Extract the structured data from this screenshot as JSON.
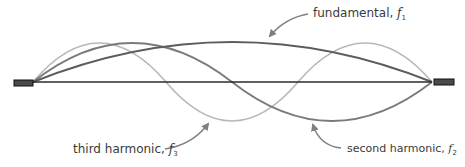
{
  "diagram": {
    "colors": {
      "string": "#2b2b2b",
      "clamp_fill": "#4a4a4a",
      "clamp_border": "#111111",
      "fundamental": "#5c5c5c",
      "second_harmonic": "#7a7a7a",
      "third_harmonic": "#b8b8b8",
      "arrow": "#808080",
      "text": "#3a3a3a"
    },
    "labels": {
      "fundamental": {
        "text": "fundamental, ",
        "symbol": "f",
        "subscript": "1"
      },
      "second_harmonic": {
        "text": "second harmonic, ",
        "symbol": "f",
        "subscript": "2"
      },
      "third_harmonic": {
        "text": "third harmonic, ",
        "symbol": "f",
        "subscript": "3"
      }
    }
  }
}
